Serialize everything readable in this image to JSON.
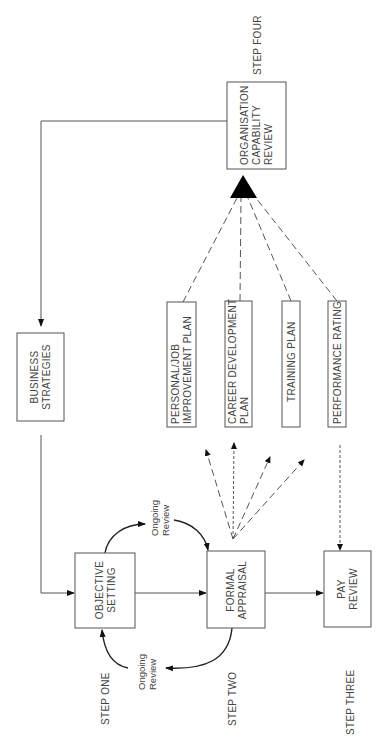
{
  "diagram": {
    "orientation": "rotated 90 degrees counter-clockwise",
    "steps": {
      "one": "STEP ONE",
      "two": "STEP TWO",
      "three": "STEP THREE",
      "four": "STEP FOUR"
    },
    "boxes": {
      "business_strategies": [
        "BUSINESS",
        "STRATEGIES"
      ],
      "objective_setting": [
        "OBJECTIVE",
        "SETTING"
      ],
      "formal_appraisal": [
        "FORMAL",
        "APPRAISAL"
      ],
      "pay_review": [
        "PAY",
        "REVIEW"
      ],
      "organisation_capability_review": [
        "ORGANISATION",
        "CAPABILITY",
        "REVIEW"
      ],
      "personal_job_improvement_plan": [
        "PERSONAL/JOB",
        "IMPROVEMENT PLAN"
      ],
      "career_development_plan": [
        "CAREER DEVELOPMENT",
        "PLAN"
      ],
      "training_plan": [
        "TRAINING PLAN"
      ],
      "performance_rating": [
        "PERFORMANCE RATING"
      ]
    },
    "ongoing_review_top": [
      "Ongoing",
      "Review"
    ],
    "ongoing_review_bottom": [
      "Ongoing",
      "Review"
    ],
    "connections": [
      {
        "from": "Business Strategies",
        "to": "Objective Setting",
        "style": "solid"
      },
      {
        "from": "Objective Setting",
        "to": "Formal Appraisal",
        "style": "solid"
      },
      {
        "from": "Formal Appraisal",
        "to": "Pay Review",
        "style": "solid"
      },
      {
        "from": "Objective Setting",
        "to": "Formal Appraisal",
        "style": "curved",
        "label": "Ongoing Review"
      },
      {
        "from": "Formal Appraisal",
        "to": "Objective Setting",
        "style": "curved",
        "label": "Ongoing Review"
      },
      {
        "from": "Formal Appraisal",
        "to": "Personal/Job Improvement Plan",
        "style": "dashed"
      },
      {
        "from": "Formal Appraisal",
        "to": "Career Development Plan",
        "style": "dashed"
      },
      {
        "from": "Formal Appraisal",
        "to": "Training Plan",
        "style": "dashed"
      },
      {
        "from": "Formal Appraisal",
        "to": "Performance Rating",
        "style": "dashed"
      },
      {
        "from": "Performance Rating",
        "to": "Pay Review",
        "style": "dotted"
      },
      {
        "from": "Plans",
        "to": "Organisation Capability Review",
        "style": "dashed-converging"
      },
      {
        "from": "Organisation Capability Review",
        "to": "Business Strategies",
        "style": "solid"
      }
    ]
  }
}
